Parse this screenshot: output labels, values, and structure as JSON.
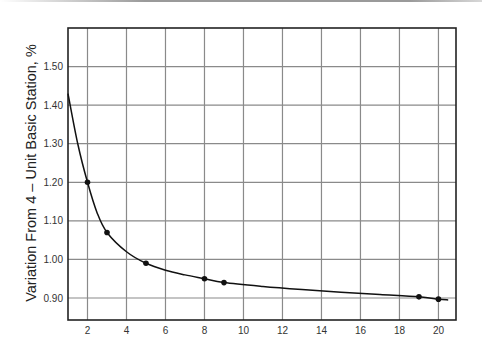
{
  "chart_data": {
    "type": "line",
    "title": "",
    "xlabel": "",
    "ylabel": "Variation From 4 – Unit Basic Station, %",
    "xlim": [
      1,
      20.9
    ],
    "ylim": [
      0.843,
      1.6
    ],
    "grid": true,
    "legend": null,
    "x_ticks": [
      2,
      4,
      6,
      8,
      10,
      12,
      14,
      16,
      18,
      20
    ],
    "x_tick_labels": [
      "2",
      "4",
      "6",
      "8",
      "10",
      "12",
      "14",
      "16",
      "18",
      "20"
    ],
    "y_ticks": [
      0.9,
      1.0,
      1.1,
      1.2,
      1.3,
      1.4,
      1.5
    ],
    "y_tick_labels": [
      "0.90",
      "1.00",
      "1.10",
      "1.20",
      "1.30",
      "1.40",
      "1.50"
    ],
    "series": [
      {
        "name": "Variation",
        "markers": true,
        "points": [
          {
            "x": 2,
            "y": 1.2
          },
          {
            "x": 3,
            "y": 1.07
          },
          {
            "x": 5,
            "y": 0.99
          },
          {
            "x": 8,
            "y": 0.95
          },
          {
            "x": 9,
            "y": 0.94
          },
          {
            "x": 19,
            "y": 0.903
          },
          {
            "x": 20,
            "y": 0.897
          }
        ],
        "curve": [
          {
            "x": 1,
            "y": 1.43
          },
          {
            "x": 1.5,
            "y": 1.3
          },
          {
            "x": 2,
            "y": 1.2
          },
          {
            "x": 2.5,
            "y": 1.12
          },
          {
            "x": 3,
            "y": 1.07
          },
          {
            "x": 4,
            "y": 1.02
          },
          {
            "x": 5,
            "y": 0.99
          },
          {
            "x": 6,
            "y": 0.972
          },
          {
            "x": 7,
            "y": 0.96
          },
          {
            "x": 8,
            "y": 0.95
          },
          {
            "x": 9,
            "y": 0.94
          },
          {
            "x": 11,
            "y": 0.93
          },
          {
            "x": 13,
            "y": 0.922
          },
          {
            "x": 15,
            "y": 0.915
          },
          {
            "x": 17,
            "y": 0.909
          },
          {
            "x": 19,
            "y": 0.903
          },
          {
            "x": 20,
            "y": 0.897
          },
          {
            "x": 20.5,
            "y": 0.895
          }
        ]
      }
    ]
  },
  "colors": {
    "frame": "#222222",
    "grid": "#8a8a8a",
    "line": "#111111",
    "marker": "#111111"
  }
}
